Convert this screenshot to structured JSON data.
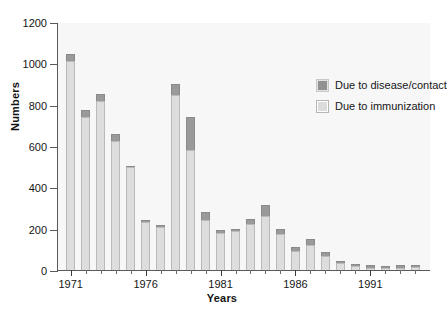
{
  "chart_data": {
    "type": "bar",
    "subtype": "stacked-vertical",
    "title": "",
    "xlabel": "Years",
    "ylabel": "Numbers",
    "ylim": [
      0,
      1200
    ],
    "yticks": [
      0,
      200,
      400,
      600,
      800,
      1000,
      1200
    ],
    "ytick_labels": [
      "0",
      "200",
      "400",
      "600",
      "800",
      "1000",
      "1200"
    ],
    "xlim": [
      1971,
      1994
    ],
    "xticks": [
      1971,
      1976,
      1981,
      1986,
      1991
    ],
    "xtick_labels": [
      "1971",
      "1976",
      "1981",
      "1986",
      "1991"
    ],
    "grid": false,
    "legend_position": "upper right",
    "categories": [
      "1971",
      "1972",
      "1973",
      "1974",
      "1975",
      "1976",
      "1977",
      "1978",
      "1979",
      "1980",
      "1981",
      "1982",
      "1983",
      "1984",
      "1985",
      "1986",
      "1987",
      "1988",
      "1989",
      "1990",
      "1991",
      "1992",
      "1993",
      "1994"
    ],
    "series": [
      {
        "name": "Due to immunization",
        "color": "#dddddd",
        "values": [
          1010,
          740,
          820,
          625,
          500,
          230,
          210,
          845,
          580,
          240,
          180,
          190,
          225,
          260,
          175,
          90,
          120,
          70,
          35,
          20,
          10,
          8,
          10,
          15
        ]
      },
      {
        "name": "Due to disease/contact",
        "color": "#9a9a9a",
        "values": [
          35,
          35,
          30,
          35,
          5,
          10,
          10,
          55,
          160,
          40,
          15,
          10,
          20,
          55,
          25,
          20,
          30,
          15,
          10,
          8,
          12,
          10,
          14,
          10
        ]
      }
    ],
    "totals": [
      1045,
      775,
      850,
      660,
      505,
      240,
      220,
      900,
      740,
      280,
      195,
      200,
      245,
      315,
      200,
      110,
      150,
      85,
      45,
      28,
      22,
      18,
      24,
      25
    ]
  },
  "legend": {
    "items": [
      {
        "label": "Due to disease/contact",
        "swatch": "dark"
      },
      {
        "label": "Due to immunization",
        "swatch": "light"
      }
    ]
  },
  "axes": {
    "y_title": "Numbers",
    "x_title": "Years"
  }
}
